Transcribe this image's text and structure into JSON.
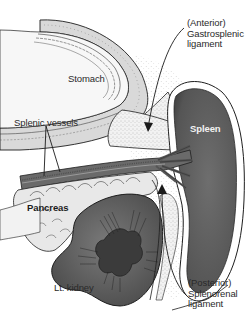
{
  "figure": {
    "type": "anatomical-illustration",
    "style": "grayscale line illustration with stippling"
  },
  "labels": {
    "stomach": "Stomach",
    "spleen": "Spleen",
    "pancreas": "Pancreas",
    "kidney": "Lt. kidney",
    "splenic_vessels": "Splenic vessels",
    "anterior_ligament": {
      "line1": "(Anterior)",
      "line2": "Gastrosplenic",
      "line3": "ligament"
    },
    "posterior_ligament": {
      "line1": "(Posterior)",
      "line2": "Splenorenal",
      "line3": "ligament"
    }
  },
  "structures": [
    {
      "name": "stomach",
      "fill": "#f4f4f4",
      "wall": "#cfcfcf"
    },
    {
      "name": "spleen",
      "fill": "#5e5e5e",
      "capsule": "#ffffff"
    },
    {
      "name": "splenic-vessels",
      "fill": "#6a6a6a"
    },
    {
      "name": "pancreas",
      "fill": "#e6e6e6"
    },
    {
      "name": "left-kidney",
      "fill": "#6e6e6e",
      "medulla": "#3b3b3b"
    },
    {
      "name": "gastrosplenic-ligament",
      "fill": "#e8e8e8"
    },
    {
      "name": "splenorenal-ligament",
      "fill": "#ececec"
    }
  ],
  "colors": {
    "background": "#ffffff",
    "outline": "#1e1e1e",
    "stipple": "#8a8a8a",
    "text": "#2a2a2a"
  }
}
